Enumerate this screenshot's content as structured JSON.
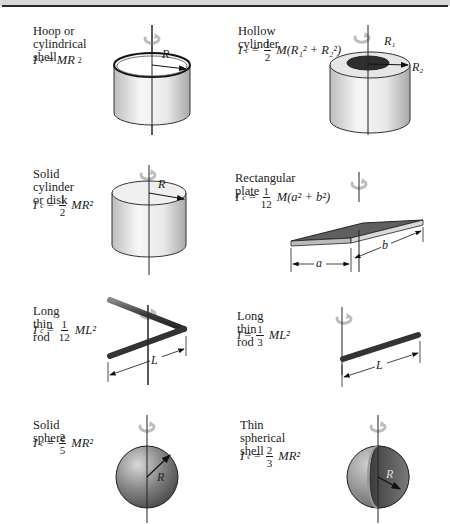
{
  "figure": {
    "items": [
      {
        "name": "Hoop or\ncylindrical shell",
        "formula": {
          "lhs": "I",
          "lhs_sub": "c",
          "coef": "",
          "expr": "MR",
          "exp": "2"
        },
        "labels": [
          "R"
        ]
      },
      {
        "name": "Hollow cylinder",
        "formula": {
          "lhs": "I",
          "lhs_sub": "c",
          "coef_num": "1",
          "coef_den": "2",
          "expr": "M(R₁² + R₂²)"
        },
        "labels": [
          "R₁",
          "R₂"
        ]
      },
      {
        "name": "Solid cylinder\nor disk",
        "formula": {
          "lhs": "I",
          "lhs_sub": "c",
          "coef_num": "1",
          "coef_den": "2",
          "expr": "MR²"
        },
        "labels": [
          "R"
        ]
      },
      {
        "name": "Rectangular plate",
        "formula": {
          "lhs": "I",
          "lhs_sub": "c",
          "coef_num": "1",
          "coef_den": "12",
          "expr": "M(a² + b²)"
        },
        "labels": [
          "a",
          "b"
        ]
      },
      {
        "name": "Long thin rod",
        "formula": {
          "lhs": "I",
          "lhs_sub": "c",
          "coef_num": "1",
          "coef_den": "12",
          "expr": "ML²"
        },
        "labels": [
          "L"
        ]
      },
      {
        "name": "Long thin rod",
        "formula": {
          "lhs": "I",
          "lhs_sub": "",
          "coef_num": "1",
          "coef_den": "3",
          "expr": "ML²"
        },
        "labels": [
          "L"
        ]
      },
      {
        "name": "Solid sphere",
        "formula": {
          "lhs": "I",
          "lhs_sub": "c",
          "coef_num": "2",
          "coef_den": "5",
          "expr": "MR²"
        },
        "labels": [
          "R"
        ]
      },
      {
        "name": "Thin spherical\nshell",
        "formula": {
          "lhs": "I",
          "lhs_sub": "c",
          "coef_num": "2",
          "coef_den": "3",
          "expr": "MR²"
        },
        "labels": [
          "R"
        ]
      }
    ],
    "equals": "=",
    "colors": {
      "surface_light": "#f2f2f2",
      "surface_mid": "#d6d6d6",
      "dark_solid": "#555555",
      "outline": "#222222",
      "rotation_arrow": "#bfbfbf"
    }
  }
}
